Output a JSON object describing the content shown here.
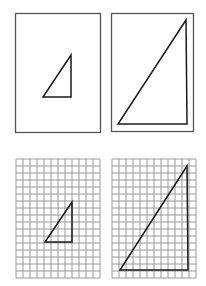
{
  "diagram": {
    "type": "similar-triangles-scaling",
    "colors": {
      "background": "#ffffff",
      "frame": "#555555",
      "grid": "#9a9a9a",
      "triangle": "#1a1a1a"
    },
    "panels": [
      {
        "id": "plain-small",
        "frame": {
          "x": 15,
          "y": 13,
          "w": 85,
          "h": 119
        },
        "grid": false,
        "triangle": [
          [
            71,
            55
          ],
          [
            43,
            97
          ],
          [
            71,
            97
          ]
        ]
      },
      {
        "id": "plain-large",
        "frame": {
          "x": 111,
          "y": 13,
          "w": 82,
          "h": 118
        },
        "grid": false,
        "inner_frame": {
          "x": 117,
          "y": 19,
          "w": 70,
          "h": 105
        },
        "triangle": [
          [
            186,
            20
          ],
          [
            118,
            124
          ],
          [
            187,
            124
          ]
        ]
      },
      {
        "id": "grid-small",
        "frame": {
          "x": 16,
          "y": 159,
          "w": 84,
          "h": 119
        },
        "grid": true,
        "cell": 7,
        "cols": 12,
        "rows": 17,
        "triangle": [
          [
            72,
            202
          ],
          [
            45,
            242
          ],
          [
            72,
            242
          ]
        ]
      },
      {
        "id": "grid-large",
        "frame": {
          "x": 112,
          "y": 159,
          "w": 84,
          "h": 119
        },
        "grid": true,
        "cell": 7,
        "cols": 12,
        "rows": 17,
        "triangle": [
          [
            187,
            166
          ],
          [
            120,
            270
          ],
          [
            188,
            270
          ]
        ]
      }
    ]
  }
}
